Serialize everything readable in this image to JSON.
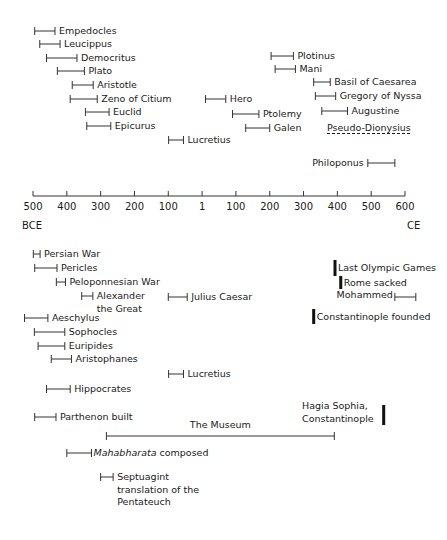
{
  "axis": {
    "ticks": [
      "500",
      "400",
      "300",
      "200",
      "100",
      "1",
      "100",
      "200",
      "300",
      "400",
      "500",
      "600"
    ],
    "tick_values": [
      -500,
      -400,
      -300,
      -200,
      -100,
      1,
      100,
      200,
      300,
      400,
      500,
      600
    ],
    "left_era": "BCE",
    "right_era": "CE",
    "x_start_px": 33,
    "x_end_px": 405,
    "y_px": 196
  },
  "upper_items": [
    {
      "label": "Empedocles",
      "start": -495,
      "end": -435,
      "y": 31,
      "label_side": "right"
    },
    {
      "label": "Leucippus",
      "start": -480,
      "end": -420,
      "y": 44,
      "label_side": "right"
    },
    {
      "label": "Democritus",
      "start": -460,
      "end": -370,
      "y": 58,
      "label_side": "right"
    },
    {
      "label": "Plato",
      "start": -428,
      "end": -348,
      "y": 71,
      "label_side": "right"
    },
    {
      "label": "Aristotle",
      "start": -384,
      "end": -322,
      "y": 85,
      "label_side": "right"
    },
    {
      "label": "Zeno of Citium",
      "start": -390,
      "end": -310,
      "y": 99,
      "label_side": "right"
    },
    {
      "label": "Euclid",
      "start": -345,
      "end": -275,
      "y": 112,
      "label_side": "right"
    },
    {
      "label": "Epicurus",
      "start": -341,
      "end": -270,
      "y": 126,
      "label_side": "right"
    },
    {
      "label": "Lucretius",
      "start": -99,
      "end": -55,
      "y": 140,
      "label_side": "right"
    },
    {
      "label": "Hero",
      "start": 10,
      "end": 70,
      "y": 99,
      "label_side": "right"
    },
    {
      "label": "Ptolemy",
      "start": 90,
      "end": 168,
      "y": 114,
      "label_side": "right"
    },
    {
      "label": "Galen",
      "start": 129,
      "end": 200,
      "y": 128,
      "label_side": "right"
    },
    {
      "label": "Plotinus",
      "start": 204,
      "end": 270,
      "y": 56,
      "label_side": "right"
    },
    {
      "label": "Mani",
      "start": 216,
      "end": 276,
      "y": 69,
      "label_side": "right"
    },
    {
      "label": "Basil of Caesarea",
      "start": 330,
      "end": 379,
      "y": 82,
      "label_side": "right"
    },
    {
      "label": "Gregory of Nyssa",
      "start": 335,
      "end": 395,
      "y": 96,
      "label_side": "right"
    },
    {
      "label": "Augustine",
      "start": 354,
      "end": 430,
      "y": 111,
      "label_side": "right"
    },
    {
      "label": "Pseudo-Dionysius",
      "start": null,
      "end": null,
      "y": 128,
      "label_side": "text-only",
      "label_x": 327
    },
    {
      "label": "Philoponus",
      "start": 490,
      "end": 570,
      "y": 163,
      "label_side": "left"
    }
  ],
  "lower_items": [
    {
      "label": "Persian War",
      "start": -499,
      "end": -479,
      "y": 254,
      "label_side": "right"
    },
    {
      "label": "Pericles",
      "start": -495,
      "end": -429,
      "y": 268,
      "label_side": "right"
    },
    {
      "label": "Peloponnesian War",
      "start": -431,
      "end": -404,
      "y": 282,
      "label_side": "right"
    },
    {
      "label": "Alexander the Great",
      "label_lines": [
        "Alexander",
        "the Great"
      ],
      "start": -356,
      "end": -323,
      "y": 296,
      "label_side": "right"
    },
    {
      "label": "Julius Caesar",
      "start": -100,
      "end": -44,
      "y": 297,
      "label_side": "right"
    },
    {
      "label": "Aeschylus",
      "start": -525,
      "end": -456,
      "y": 318,
      "label_side": "right"
    },
    {
      "label": "Sophocles",
      "start": -496,
      "end": -406,
      "y": 332,
      "label_side": "right"
    },
    {
      "label": "Euripides",
      "start": -485,
      "end": -406,
      "y": 346,
      "label_side": "right"
    },
    {
      "label": "Aristophanes",
      "start": -446,
      "end": -386,
      "y": 359,
      "label_side": "right"
    },
    {
      "label": "Lucretius",
      "start": -99,
      "end": -55,
      "y": 374,
      "label_side": "right"
    },
    {
      "label": "Hippocrates",
      "start": -460,
      "end": -390,
      "y": 389,
      "label_side": "right"
    },
    {
      "label": "Parthenon built",
      "start": -495,
      "end": -432,
      "y": 417,
      "label_side": "right"
    },
    {
      "label": "The Museum",
      "start": -283,
      "end": 391,
      "y": 436,
      "label_side": "above"
    },
    {
      "label": "Mahabharata composed",
      "label_italic": "Mahabharata",
      "label_rest": " composed",
      "start": -400,
      "end": -327,
      "y": 453,
      "label_side": "right"
    },
    {
      "label": "Septuagint translation of the Pentateuch",
      "label_lines": [
        "Septuagint",
        "translation of the",
        "Pentateuch"
      ],
      "start": -300,
      "end": -263,
      "y": 477,
      "label_side": "right"
    }
  ],
  "events": [
    {
      "label": "Last Olympic Games",
      "year": 393,
      "y_top": 260,
      "y_bottom": 276
    },
    {
      "label": "Rome sacked",
      "year": 410,
      "y_top": 276,
      "y_bottom": 289
    },
    {
      "label": "Constantinople founded",
      "year": 330,
      "y_top": 309,
      "y_bottom": 324
    },
    {
      "label": "Hagia Sophia, Constantinople",
      "label_lines": [
        "Hagia Sophia,",
        "Constantinople"
      ],
      "year": 537,
      "y_top": 405,
      "y_bottom": 425
    }
  ],
  "mohammed": {
    "label": "Mohammed",
    "start": 570,
    "end": 632,
    "y": 297
  },
  "chart_data": {
    "type": "timeline",
    "title": "",
    "xlabel": "",
    "ylabel": "",
    "x_range": [
      -500,
      600
    ],
    "x_ticks": [
      -500,
      -400,
      -300,
      -200,
      -100,
      1,
      100,
      200,
      300,
      400,
      500,
      600
    ],
    "era_labels": {
      "left": "BCE",
      "right": "CE"
    },
    "spans": [
      {
        "name": "Empedocles",
        "start": -495,
        "end": -435
      },
      {
        "name": "Leucippus",
        "start": -480,
        "end": -420
      },
      {
        "name": "Democritus",
        "start": -460,
        "end": -370
      },
      {
        "name": "Plato",
        "start": -428,
        "end": -348
      },
      {
        "name": "Aristotle",
        "start": -384,
        "end": -322
      },
      {
        "name": "Zeno of Citium",
        "start": -390,
        "end": -310
      },
      {
        "name": "Euclid",
        "start": -345,
        "end": -275
      },
      {
        "name": "Epicurus",
        "start": -341,
        "end": -270
      },
      {
        "name": "Lucretius",
        "start": -99,
        "end": -55
      },
      {
        "name": "Hero",
        "start": 10,
        "end": 70
      },
      {
        "name": "Ptolemy",
        "start": 90,
        "end": 168
      },
      {
        "name": "Galen",
        "start": 129,
        "end": 200
      },
      {
        "name": "Plotinus",
        "start": 204,
        "end": 270
      },
      {
        "name": "Mani",
        "start": 216,
        "end": 276
      },
      {
        "name": "Basil of Caesarea",
        "start": 330,
        "end": 379
      },
      {
        "name": "Gregory of Nyssa",
        "start": 335,
        "end": 395
      },
      {
        "name": "Augustine",
        "start": 354,
        "end": 430
      },
      {
        "name": "Philoponus",
        "start": 490,
        "end": 570
      },
      {
        "name": "Persian War",
        "start": -499,
        "end": -479
      },
      {
        "name": "Pericles",
        "start": -495,
        "end": -429
      },
      {
        "name": "Peloponnesian War",
        "start": -431,
        "end": -404
      },
      {
        "name": "Alexander the Great",
        "start": -356,
        "end": -323
      },
      {
        "name": "Julius Caesar",
        "start": -100,
        "end": -44
      },
      {
        "name": "Aeschylus",
        "start": -525,
        "end": -456
      },
      {
        "name": "Sophocles",
        "start": -496,
        "end": -406
      },
      {
        "name": "Euripides",
        "start": -485,
        "end": -406
      },
      {
        "name": "Aristophanes",
        "start": -446,
        "end": -386
      },
      {
        "name": "Hippocrates",
        "start": -460,
        "end": -390
      },
      {
        "name": "Parthenon built",
        "start": -495,
        "end": -432
      },
      {
        "name": "The Museum",
        "start": -283,
        "end": 391
      },
      {
        "name": "Mahabharata composed",
        "start": -400,
        "end": -327
      },
      {
        "name": "Septuagint translation of the Pentateuch",
        "start": -300,
        "end": -263
      },
      {
        "name": "Mohammed",
        "start": 570,
        "end": 632
      }
    ],
    "point_events": [
      {
        "name": "Last Olympic Games",
        "year": 393
      },
      {
        "name": "Rome sacked",
        "year": 410
      },
      {
        "name": "Constantinople founded",
        "year": 330
      },
      {
        "name": "Hagia Sophia, Constantinople",
        "year": 537
      }
    ],
    "text_only": [
      "Pseudo-Dionysius"
    ]
  }
}
